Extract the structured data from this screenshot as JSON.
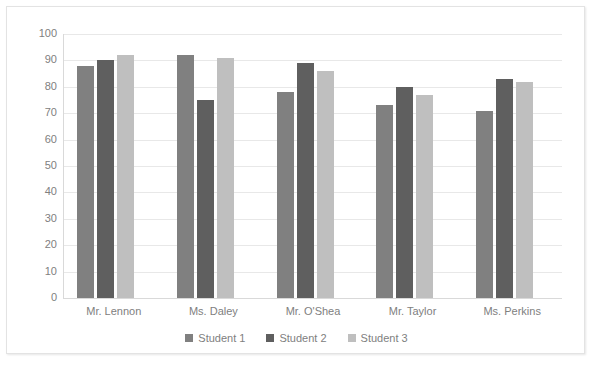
{
  "chart_data": {
    "type": "bar",
    "title": "",
    "xlabel": "",
    "ylabel": "",
    "ylim": [
      0,
      100
    ],
    "ytick_step": 10,
    "ytick_labels": [
      "100",
      "90",
      "80",
      "70",
      "60",
      "50",
      "40",
      "30",
      "20",
      "10",
      "0"
    ],
    "grid": true,
    "legend_position": "bottom",
    "categories": [
      "Mr. Lennon",
      "Ms. Daley",
      "Mr. O'Shea",
      "Mr. Taylor",
      "Ms. Perkins"
    ],
    "series": [
      {
        "name": "Student 1",
        "color": "#808080",
        "values": [
          88,
          92,
          78,
          73,
          71
        ]
      },
      {
        "name": "Student 2",
        "color": "#5f5f5f",
        "values": [
          90,
          75,
          89,
          80,
          83
        ]
      },
      {
        "name": "Student 3",
        "color": "#bfbfbf",
        "values": [
          92,
          91,
          86,
          77,
          82
        ]
      }
    ]
  },
  "colors": {
    "gridline": "#e8e8e8",
    "axis": "#d9d9d9",
    "text": "#808080",
    "frame_border": "#e3e3e3",
    "background": "#ffffff"
  }
}
